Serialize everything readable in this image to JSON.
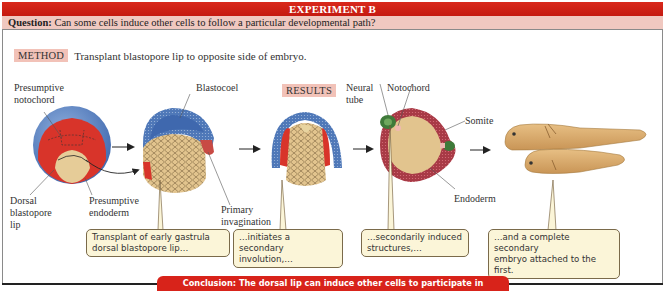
{
  "header": {
    "title": "EXPERIMENT B",
    "question_label": "Question:",
    "question_text": "Can some cells induce other cells to follow a particular developmental path?"
  },
  "method": {
    "tag": "METHOD",
    "text": "Transplant blastopore lip to opposite side of embryo."
  },
  "results": {
    "tag": "RESULTS"
  },
  "labels": {
    "presumptive_notochord": [
      "Presumptive",
      "notochord"
    ],
    "dorsal_blastopore_lip": [
      "Dorsal",
      "blastopore",
      "lip"
    ],
    "presumptive_endoderm": [
      "Presumptive",
      "endoderm"
    ],
    "blastocoel": "Blastocoel",
    "primary_invagination": [
      "Primary",
      "invagination"
    ],
    "neural_tube": [
      "Neural",
      "tube"
    ],
    "notochord": "Notochord",
    "somite": "Somite",
    "endoderm": "Endoderm"
  },
  "callouts": [
    {
      "lines": [
        "Transplant of early gastrula",
        "dorsal blastopore lip…"
      ]
    },
    {
      "lines": [
        "…initiates a secondary",
        "involution,…"
      ]
    },
    {
      "lines": [
        "…secondarily induced",
        "structures,…"
      ]
    },
    {
      "lines": [
        "…and a complete secondary",
        "embryo attached to the first."
      ]
    }
  ],
  "conclusion": "Conclusion: The dorsal lip can induce other cells to participate in embryogenesis.",
  "colors": {
    "title_red": "#d0241a",
    "question_pink": "#f0c8c0",
    "tag_pink": "#f2c2b8",
    "ectoderm_blue": "#4f78b8",
    "mesoderm_red": "#d8342a",
    "endoderm_tan": "#e6cc98",
    "callout_fill": "#fbf5d8",
    "embryo_tan": "#d9aa6a"
  }
}
